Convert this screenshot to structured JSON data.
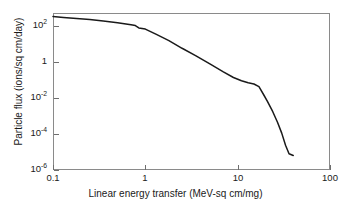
{
  "chart_data": {
    "type": "line",
    "title": "",
    "xlabel": "Linear energy transfer (MeV-sq cm/mg)",
    "ylabel": "Particle flux (ions/sq cm/day)",
    "xscale": "log",
    "yscale": "log",
    "xlim": [
      0.1,
      100
    ],
    "ylim": [
      1e-06,
      1000
    ],
    "grid": false,
    "legend": null,
    "xticks": [
      0.1,
      1,
      10,
      100
    ],
    "xtick_labels": [
      "0.1",
      "1",
      "10",
      "100"
    ],
    "yticks": [
      1e-06,
      0.0001,
      0.01,
      1,
      100
    ],
    "ytick_labels": [
      "10-6",
      "10-4",
      "10-2",
      "1",
      "102"
    ],
    "series": [
      {
        "name": "Integral particle flux",
        "color": "#1a1a1a",
        "linewidth": 1.5,
        "x": [
          0.1,
          0.13,
          0.18,
          0.25,
          0.35,
          0.5,
          0.7,
          0.78,
          0.85,
          1.0,
          1.3,
          1.8,
          2.5,
          3.5,
          5.0,
          7.0,
          9.0,
          11.0,
          13.0,
          15.0,
          17.0,
          19.0,
          21.0,
          24.0,
          27.0,
          30.0,
          33.0,
          36.0,
          40.0
        ],
        "y": [
          620,
          560,
          490,
          420,
          350,
          280,
          210,
          190,
          140,
          120,
          62,
          26,
          9.5,
          3.6,
          1.2,
          0.42,
          0.2,
          0.13,
          0.1,
          0.085,
          0.06,
          0.022,
          0.0085,
          0.0022,
          0.00055,
          0.00013,
          2.6e-05,
          8.5e-06,
          6.8e-06
        ]
      }
    ]
  },
  "ylabels_markup": [
    "10<sup>-6</sup>",
    "10<sup>-4</sup>",
    "10<sup>-2</sup>",
    "1",
    "10<sup>2</sup>"
  ]
}
